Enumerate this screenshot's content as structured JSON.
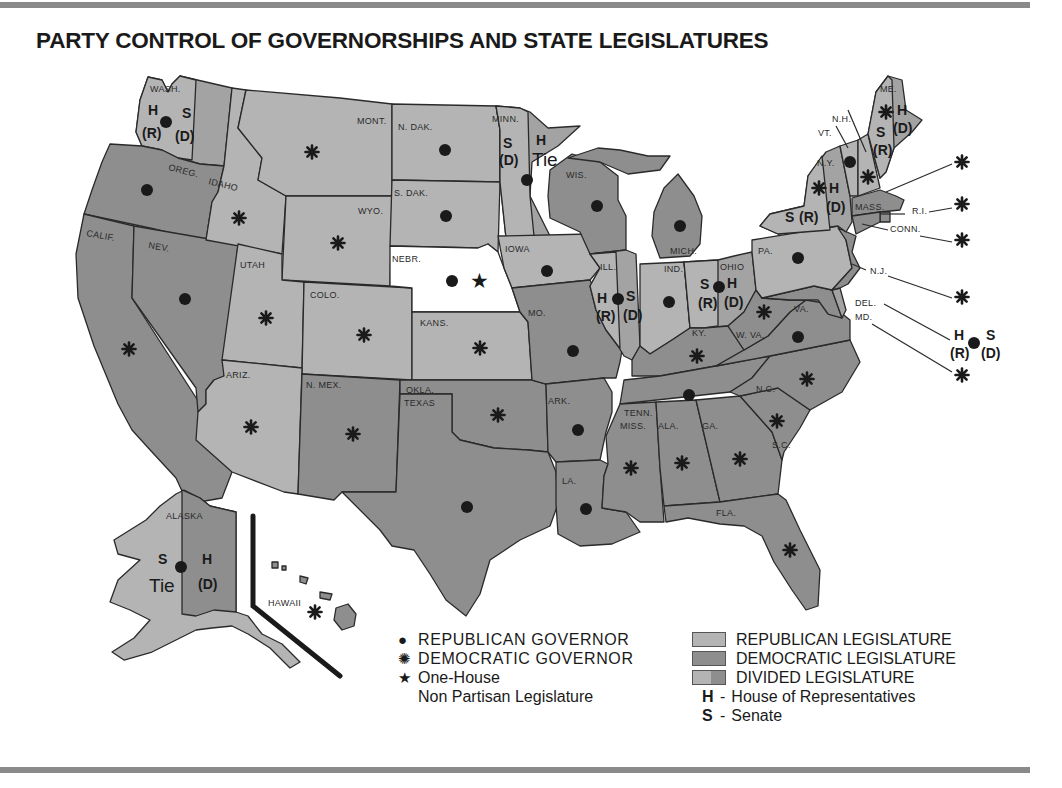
{
  "title": "PARTY CONTROL OF GOVERNORSHIPS AND STATE LEGISLATURES",
  "colors": {
    "republican_legislature": "#b4b4b4",
    "democratic_legislature": "#8e8e8e",
    "divided_legislature": "#a3a3a3",
    "nonpartisan": "#ffffff",
    "outline": "#2a2a2a",
    "rule": "#8a8a8a"
  },
  "legend": {
    "republican_governor": {
      "symbol": "●",
      "label": "REPUBLICAN GOVERNOR"
    },
    "democratic_governor": {
      "symbol": "✺",
      "label": "DEMOCRATIC GOVERNOR"
    },
    "one_house": {
      "symbol": "★",
      "label_line1": "One-House",
      "label_line2": "Non Partisan Legislature"
    },
    "republican_legislature": "REPUBLICAN LEGISLATURE",
    "democratic_legislature": "DEMOCRATIC LEGISLATURE",
    "divided_legislature": "DIVIDED LEGISLATURE",
    "house": {
      "abbr": "H",
      "dash": "-",
      "label": "House of Representatives"
    },
    "senate": {
      "abbr": "S",
      "dash": "-",
      "label": "Senate"
    }
  },
  "states": [
    {
      "abbr": "WASH.",
      "governor": "R",
      "legislature": "divided",
      "house": "(R)",
      "senate": "(D)"
    },
    {
      "abbr": "OREG.",
      "governor": "R",
      "legislature": "D"
    },
    {
      "abbr": "CALIF.",
      "governor": "D",
      "legislature": "D"
    },
    {
      "abbr": "NEV.",
      "governor": "R",
      "legislature": "D"
    },
    {
      "abbr": "IDAHO",
      "governor": "D",
      "legislature": "R"
    },
    {
      "abbr": "MONT.",
      "governor": "D",
      "legislature": "R"
    },
    {
      "abbr": "WYO.",
      "governor": "D",
      "legislature": "R"
    },
    {
      "abbr": "UTAH",
      "governor": "D",
      "legislature": "R"
    },
    {
      "abbr": "COLO.",
      "governor": "D",
      "legislature": "R"
    },
    {
      "abbr": "ARIZ.",
      "governor": "D",
      "legislature": "R"
    },
    {
      "abbr": "N. MEX.",
      "governor": "D",
      "legislature": "D"
    },
    {
      "abbr": "N. DAK.",
      "governor": "R",
      "legislature": "R"
    },
    {
      "abbr": "S. DAK.",
      "governor": "R",
      "legislature": "R"
    },
    {
      "abbr": "NEBR.",
      "governor": "R",
      "legislature": "nonpartisan"
    },
    {
      "abbr": "KANS.",
      "governor": "D",
      "legislature": "R"
    },
    {
      "abbr": "OKLA.",
      "governor": "D",
      "legislature": "D"
    },
    {
      "abbr": "TEXAS",
      "governor": "R",
      "legislature": "D"
    },
    {
      "abbr": "MINN.",
      "governor": "R",
      "legislature": "divided",
      "house": "Tie",
      "senate": "(D)"
    },
    {
      "abbr": "IOWA",
      "governor": "R",
      "legislature": "R"
    },
    {
      "abbr": "MO.",
      "governor": "R",
      "legislature": "D"
    },
    {
      "abbr": "ARK.",
      "governor": "R",
      "legislature": "D"
    },
    {
      "abbr": "LA.",
      "governor": "R",
      "legislature": "D"
    },
    {
      "abbr": "WIS.",
      "governor": "R",
      "legislature": "D"
    },
    {
      "abbr": "ILL.",
      "governor": "R",
      "legislature": "divided",
      "house": "(R)",
      "senate": "(D)"
    },
    {
      "abbr": "MICH.",
      "governor": "R",
      "legislature": "D"
    },
    {
      "abbr": "IND.",
      "governor": "R",
      "legislature": "R"
    },
    {
      "abbr": "OHIO",
      "governor": "R",
      "legislature": "divided",
      "house": "(D)",
      "senate": "(R)"
    },
    {
      "abbr": "KY.",
      "governor": "D",
      "legislature": "D"
    },
    {
      "abbr": "TENN.",
      "governor": "R",
      "legislature": "D"
    },
    {
      "abbr": "MISS.",
      "governor": "D",
      "legislature": "D"
    },
    {
      "abbr": "ALA.",
      "governor": "D",
      "legislature": "D"
    },
    {
      "abbr": "GA.",
      "governor": "D",
      "legislature": "D"
    },
    {
      "abbr": "FLA.",
      "governor": "D",
      "legislature": "D"
    },
    {
      "abbr": "S.C.",
      "governor": "D",
      "legislature": "D"
    },
    {
      "abbr": "N.C.",
      "governor": "D",
      "legislature": "D"
    },
    {
      "abbr": "VA.",
      "governor": "R",
      "legislature": "D"
    },
    {
      "abbr": "W. VA.",
      "governor": "D",
      "legislature": "D"
    },
    {
      "abbr": "PA.",
      "governor": "R",
      "legislature": "R"
    },
    {
      "abbr": "N.Y.",
      "governor": "D",
      "legislature": "divided",
      "house": "(D)",
      "senate": "(R)"
    },
    {
      "abbr": "VT.",
      "governor": "R",
      "legislature": "R"
    },
    {
      "abbr": "N.H.",
      "governor": "D",
      "legislature": "R"
    },
    {
      "abbr": "ME.",
      "governor": "D",
      "legislature": "divided",
      "house": "(D)",
      "senate": "(R)"
    },
    {
      "abbr": "MASS.",
      "governor": "D",
      "legislature": "D"
    },
    {
      "abbr": "R.I.",
      "governor": "D",
      "legislature": "D"
    },
    {
      "abbr": "CONN.",
      "governor": "D",
      "legislature": "D"
    },
    {
      "abbr": "N.J.",
      "governor": "D",
      "legislature": "D"
    },
    {
      "abbr": "DEL.",
      "governor": "R",
      "legislature": "divided",
      "house": "(R)",
      "senate": "(D)"
    },
    {
      "abbr": "MD.",
      "governor": "D",
      "legislature": "D"
    },
    {
      "abbr": "ALASKA",
      "governor": "R",
      "legislature": "divided",
      "house": "(D)",
      "senate": "Tie"
    },
    {
      "abbr": "HAWAII",
      "governor": "D",
      "legislature": "D"
    }
  ],
  "marks": {
    "H": "H",
    "S": "S",
    "R": "(R)",
    "D": "(D)",
    "Tie": "Tie"
  }
}
